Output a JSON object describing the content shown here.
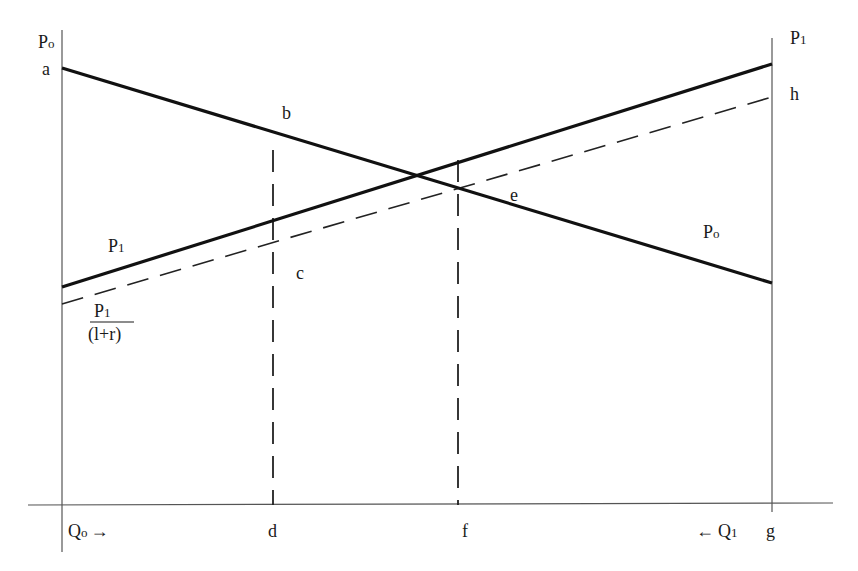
{
  "diagram": {
    "type": "two-period resource allocation (Hotelling) diagram",
    "colors": {
      "lines": "#111111",
      "axes": "#555555",
      "background": "#ffffff"
    },
    "axes": {
      "left_axis_label_main": "P",
      "left_axis_label_sub": "o",
      "right_axis_label_main": "P",
      "right_axis_label_sub": "1",
      "x_left_label_main": "Q",
      "x_left_label_sub": "o",
      "x_left_arrow": "→",
      "x_right_arrow": "←",
      "x_right_label_main": "Q",
      "x_right_label_sub": "1"
    },
    "points": {
      "a": "a",
      "b": "b",
      "c": "c",
      "d": "d",
      "e": "e",
      "f": "f",
      "g": "g",
      "h": "h"
    },
    "curves": {
      "p0_curve_label_main": "P",
      "p0_curve_label_sub": "o",
      "p1_curve_label_main": "P",
      "p1_curve_label_sub": "1",
      "discounted_numerator_main": "P",
      "discounted_numerator_sub": "1",
      "discounted_denominator": "(l+r)"
    },
    "geometry": {
      "left_axis_x": 62,
      "right_axis_x": 772,
      "x_axis_y": 505,
      "p0_line": [
        [
          62,
          68
        ],
        [
          772,
          283
        ]
      ],
      "p1_line": [
        [
          62,
          287
        ],
        [
          772,
          64
        ]
      ],
      "p1_discounted_line": [
        [
          62,
          304
        ],
        [
          772,
          97
        ]
      ],
      "d_vertical_x": 273,
      "f_vertical_x": 458
    }
  }
}
